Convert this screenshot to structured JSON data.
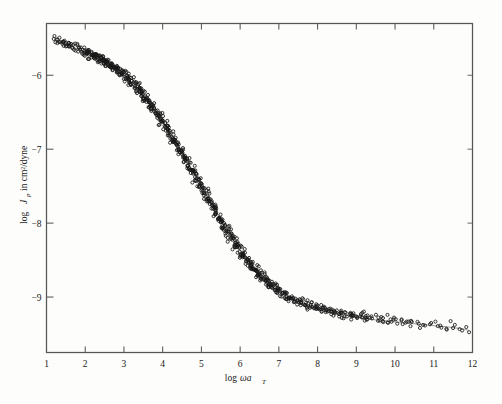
{
  "figure": {
    "background_color": "#fdfdfb",
    "frame_color": "#55565a",
    "marker_color": "#171717",
    "curve_color": "#6b6b6b"
  },
  "axes": {
    "x_title_prefix": "log",
    "x_title_omega": "ωa",
    "x_title_subscript": "T",
    "y_title_prefix": "log",
    "y_title_symbol": "J",
    "y_title_subscript": "p",
    "y_title_suffix": "in cm²/dyne"
  },
  "chart_data": {
    "type": "scatter",
    "title": "",
    "xlabel": "log ωa_T",
    "ylabel": "log J_p in cm²/dyne",
    "xlim": [
      1,
      12
    ],
    "ylim": [
      -9.75,
      -5.3
    ],
    "grid": false,
    "legend": null,
    "xticks": [
      1,
      2,
      3,
      4,
      5,
      6,
      7,
      8,
      9,
      10,
      11,
      12
    ],
    "xtick_labels": [
      "1",
      "2",
      "3",
      "4",
      "5",
      "6",
      "7",
      "8",
      "9",
      "10",
      "11",
      "12"
    ],
    "yticks": [
      -6,
      -7,
      -8,
      -9
    ],
    "ytick_labels": [
      "−6",
      "−7",
      "−8",
      "−9"
    ],
    "marker": "open-circle",
    "marker_size": 3.1,
    "series": [
      {
        "name": "creep compliance master curve",
        "x": [
          1.3,
          1.34,
          1.38,
          1.43,
          1.47,
          1.52,
          1.57,
          1.62,
          1.68,
          1.74,
          1.8,
          1.86,
          1.92,
          1.98,
          2.04,
          2.1,
          2.16,
          2.22,
          2.28,
          2.34,
          2.4,
          2.46,
          2.52,
          2.58,
          2.64,
          2.7,
          2.76,
          2.82,
          2.88,
          2.94,
          3.0,
          3.07,
          3.13,
          3.19,
          3.25,
          3.31,
          3.37,
          3.43,
          3.49,
          3.55,
          3.61,
          3.67,
          3.73,
          3.79,
          3.85,
          3.91,
          3.97,
          4.03,
          4.09,
          4.15,
          4.21,
          4.27,
          4.33,
          4.39,
          4.45,
          4.51,
          4.57,
          4.63,
          4.69,
          4.75,
          4.81,
          4.87,
          4.93,
          4.99,
          5.05,
          5.11,
          5.17,
          5.23,
          5.29,
          5.35,
          5.41,
          5.47,
          5.53,
          5.59,
          5.65,
          5.71,
          5.77,
          5.83,
          5.89,
          5.95,
          6.01,
          6.07,
          6.13,
          6.19,
          6.25,
          6.31,
          6.37,
          6.43,
          6.49,
          6.55,
          6.61,
          6.67,
          6.73,
          6.79,
          6.85,
          6.91,
          6.97,
          7.03,
          7.1,
          7.17,
          7.24,
          7.31,
          7.38,
          7.45,
          7.52,
          7.6,
          7.68,
          7.76,
          7.84,
          7.92,
          8.0,
          8.09,
          8.18,
          8.27,
          8.36,
          8.45,
          8.55,
          8.65,
          8.75,
          8.85,
          8.95,
          9.06,
          9.17,
          9.28,
          9.39,
          9.5,
          9.62,
          9.74,
          9.86,
          9.98,
          10.1,
          10.23,
          10.36,
          10.49,
          10.62,
          10.75,
          10.89,
          11.03,
          11.17,
          11.31,
          11.45,
          11.6,
          11.75,
          11.9
        ],
        "y": [
          -5.54,
          -5.55,
          -5.56,
          -5.57,
          -5.58,
          -5.59,
          -5.6,
          -5.61,
          -5.62,
          -5.63,
          -5.645,
          -5.66,
          -5.675,
          -5.69,
          -5.705,
          -5.72,
          -5.735,
          -5.75,
          -5.765,
          -5.78,
          -5.795,
          -5.81,
          -5.83,
          -5.85,
          -5.87,
          -5.89,
          -5.91,
          -5.93,
          -5.95,
          -5.975,
          -6.0,
          -6.03,
          -6.06,
          -6.09,
          -6.12,
          -6.15,
          -6.18,
          -6.22,
          -6.26,
          -6.3,
          -6.34,
          -6.38,
          -6.42,
          -6.46,
          -6.5,
          -6.55,
          -6.6,
          -6.65,
          -6.7,
          -6.75,
          -6.8,
          -6.85,
          -6.9,
          -6.95,
          -7.0,
          -7.05,
          -7.1,
          -7.15,
          -7.21,
          -7.27,
          -7.32,
          -7.38,
          -7.43,
          -7.49,
          -7.54,
          -7.6,
          -7.65,
          -7.71,
          -7.76,
          -7.82,
          -7.87,
          -7.93,
          -7.98,
          -8.03,
          -8.08,
          -8.13,
          -8.18,
          -8.23,
          -8.28,
          -8.33,
          -8.37,
          -8.42,
          -8.46,
          -8.5,
          -8.54,
          -8.58,
          -8.62,
          -8.65,
          -8.69,
          -8.72,
          -8.75,
          -8.78,
          -8.81,
          -8.84,
          -8.86,
          -8.89,
          -8.91,
          -8.93,
          -8.96,
          -8.98,
          -9.0,
          -9.02,
          -9.04,
          -9.05,
          -9.07,
          -9.09,
          -9.1,
          -9.12,
          -9.13,
          -9.15,
          -9.16,
          -9.17,
          -9.18,
          -9.2,
          -9.21,
          -9.22,
          -9.23,
          -9.24,
          -9.25,
          -9.26,
          -9.27,
          -9.28,
          -9.285,
          -9.29,
          -9.3,
          -9.31,
          -9.315,
          -9.32,
          -9.33,
          -9.335,
          -9.34,
          -9.35,
          -9.355,
          -9.36,
          -9.37,
          -9.375,
          -9.38,
          -9.39,
          -9.395,
          -9.4,
          -9.41,
          -9.42,
          -9.43,
          -9.45
        ]
      }
    ]
  }
}
